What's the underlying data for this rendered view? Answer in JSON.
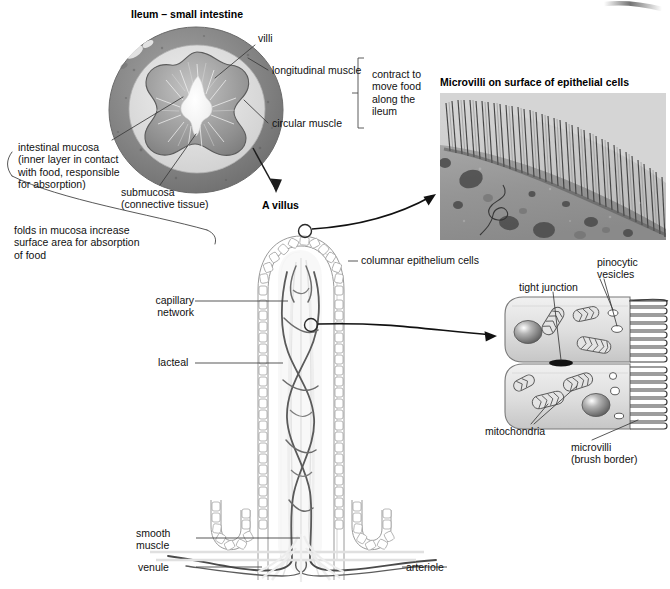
{
  "figure": {
    "domain": "biology-diagram",
    "background": "#ffffff",
    "ink": "#1a1a1a"
  },
  "titles": {
    "ileum": "Ileum – small intestine",
    "villus": "A villus",
    "microvilli_photo": "Microvilli on surface of epithelial cells"
  },
  "labels": {
    "villi": "villi",
    "longitudinal_muscle": "longitudinal muscle",
    "circular_muscle": "circular muscle",
    "contract_note": "contract to\nmove food\nalong the\nileum",
    "intestinal_mucosa": "intestinal mucosa\n(inner layer in contact\nwith food, responsible\nfor absorption)",
    "submucosa": "submucosa\n(connective tissue)",
    "folds_note": "folds in mucosa increase\nsurface area for absorption\nof food",
    "columnar_epithelium": "columnar epithelium cells",
    "capillary_network": "capillary\nnetwork",
    "lacteal": "lacteal",
    "smooth_muscle": "smooth\nmuscle",
    "venule": "venule",
    "arteriole": "arteriole",
    "tight_junction": "tight junction",
    "pinocytic_vesicles": "pinocytic\nvesicles",
    "mitochondria": "mitochondria",
    "microvilli_brush": "microvilli\n(brush border)"
  },
  "colors": {
    "leader_line": "#3a3a3a",
    "vessel_dark": "#4a4a4a",
    "vessel_mid": "#6e6e6e",
    "lacteal_light": "#d8d8d8",
    "epithelium_outline": "#8d8d8d",
    "cell_fill_top": "#e9e9e9",
    "cell_fill_bottom": "#cfcfcf",
    "nucleus": "#6a6a6a",
    "tissue_outer": "#8e8e8e",
    "tissue_mid": "#b9b9b9",
    "tissue_inner": "#9c9c9c",
    "photo_bg": "#9a9a9a"
  }
}
